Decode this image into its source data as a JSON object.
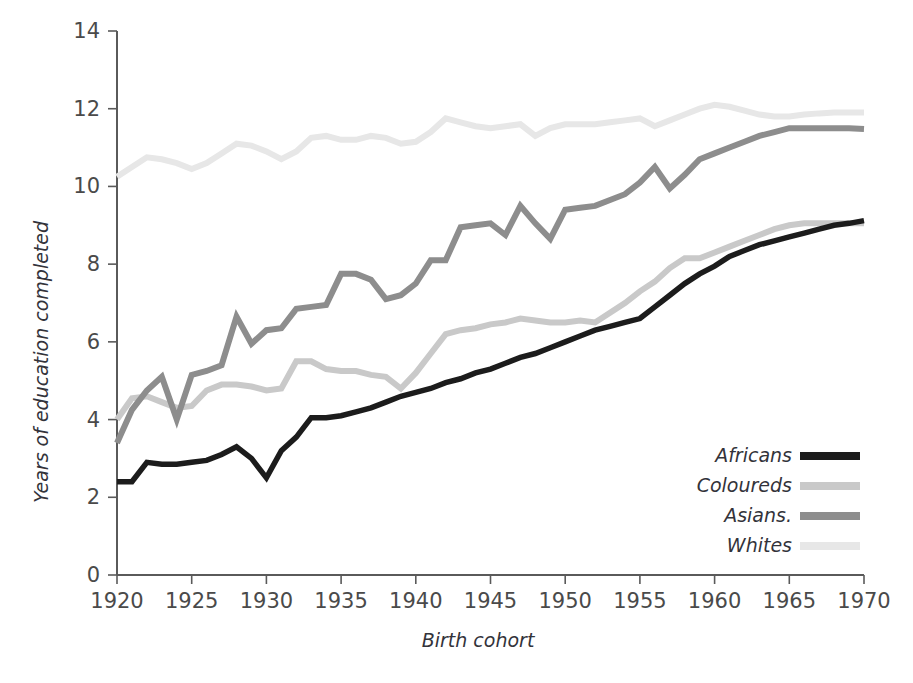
{
  "chart_data": {
    "type": "line",
    "title": "",
    "xlabel": "Birth cohort",
    "ylabel": "Years of education completed",
    "xlim": [
      1920,
      1970
    ],
    "ylim": [
      0,
      14
    ],
    "xticks": [
      1920,
      1925,
      1930,
      1935,
      1940,
      1945,
      1950,
      1955,
      1960,
      1965,
      1970
    ],
    "yticks": [
      0,
      2,
      4,
      6,
      8,
      10,
      12,
      14
    ],
    "grid": false,
    "legend_position": "bottom-right",
    "x": [
      1920,
      1921,
      1922,
      1923,
      1924,
      1925,
      1926,
      1927,
      1928,
      1929,
      1930,
      1931,
      1932,
      1933,
      1934,
      1935,
      1936,
      1937,
      1938,
      1939,
      1940,
      1941,
      1942,
      1943,
      1944,
      1945,
      1946,
      1947,
      1948,
      1949,
      1950,
      1951,
      1952,
      1953,
      1954,
      1955,
      1956,
      1957,
      1958,
      1959,
      1960,
      1961,
      1962,
      1963,
      1964,
      1965,
      1966,
      1967,
      1968,
      1969,
      1970
    ],
    "series": [
      {
        "name": "Africans",
        "color": "#1c1c1c",
        "width": 5.5,
        "values": [
          2.4,
          2.4,
          2.9,
          2.85,
          2.85,
          2.9,
          2.95,
          3.1,
          3.3,
          3.0,
          2.5,
          3.2,
          3.55,
          4.05,
          4.05,
          4.1,
          4.2,
          4.3,
          4.45,
          4.6,
          4.7,
          4.8,
          4.95,
          5.05,
          5.2,
          5.3,
          5.45,
          5.6,
          5.7,
          5.85,
          6.0,
          6.15,
          6.3,
          6.4,
          6.5,
          6.6,
          6.9,
          7.2,
          7.5,
          7.75,
          7.95,
          8.2,
          8.35,
          8.5,
          8.6,
          8.7,
          8.8,
          8.9,
          9.0,
          9.05,
          9.12
        ]
      },
      {
        "name": "Coloureds",
        "color": "#c9c9c9",
        "width": 6,
        "values": [
          4.0,
          4.55,
          4.6,
          4.45,
          4.3,
          4.35,
          4.75,
          4.9,
          4.9,
          4.85,
          4.75,
          4.8,
          5.5,
          5.5,
          5.3,
          5.25,
          5.25,
          5.15,
          5.1,
          4.8,
          5.2,
          5.7,
          6.2,
          6.3,
          6.35,
          6.45,
          6.5,
          6.6,
          6.55,
          6.5,
          6.5,
          6.55,
          6.5,
          6.75,
          7.0,
          7.3,
          7.55,
          7.9,
          8.15,
          8.15,
          8.3,
          8.45,
          8.6,
          8.75,
          8.9,
          9.0,
          9.05,
          9.05,
          9.05,
          9.05,
          9.05
        ]
      },
      {
        "name": "Asians.",
        "color": "#8d8d8d",
        "width": 6,
        "values": [
          3.4,
          4.25,
          4.75,
          5.1,
          4.0,
          5.15,
          5.25,
          5.4,
          6.65,
          5.95,
          6.3,
          6.35,
          6.85,
          6.9,
          6.95,
          7.75,
          7.75,
          7.6,
          7.1,
          7.2,
          7.5,
          8.1,
          8.1,
          8.95,
          9.0,
          9.05,
          8.75,
          9.5,
          9.05,
          8.65,
          9.4,
          9.45,
          9.5,
          9.65,
          9.8,
          10.1,
          10.5,
          9.95,
          10.3,
          10.7,
          10.85,
          11.0,
          11.15,
          11.3,
          11.4,
          11.5,
          11.5,
          11.5,
          11.5,
          11.5,
          11.48
        ]
      },
      {
        "name": "Whites",
        "color": "#e7e7e7",
        "width": 6,
        "values": [
          10.25,
          10.5,
          10.75,
          10.7,
          10.6,
          10.45,
          10.6,
          10.85,
          11.1,
          11.05,
          10.9,
          10.7,
          10.9,
          11.25,
          11.3,
          11.2,
          11.2,
          11.3,
          11.25,
          11.1,
          11.15,
          11.4,
          11.75,
          11.65,
          11.55,
          11.5,
          11.55,
          11.6,
          11.3,
          11.5,
          11.6,
          11.6,
          11.6,
          11.65,
          11.7,
          11.75,
          11.55,
          11.7,
          11.85,
          12.0,
          12.1,
          12.05,
          11.95,
          11.85,
          11.8,
          11.8,
          11.85,
          11.88,
          11.9,
          11.9,
          11.9
        ]
      }
    ]
  },
  "axes": {
    "x_title": "Birth cohort",
    "y_title": "Years of education completed",
    "x_tick_labels": [
      "1920",
      "1925",
      "1930",
      "1935",
      "1940",
      "1945",
      "1950",
      "1955",
      "1960",
      "1965",
      "1970"
    ],
    "y_tick_labels": [
      "0",
      "2",
      "4",
      "6",
      "8",
      "10",
      "12",
      "14"
    ]
  },
  "legend": {
    "items": [
      {
        "label": "Africans",
        "color": "#1c1c1c"
      },
      {
        "label": "Coloureds",
        "color": "#c9c9c9"
      },
      {
        "label": "Asians.",
        "color": "#8d8d8d"
      },
      {
        "label": "Whites",
        "color": "#e7e7e7"
      }
    ]
  }
}
